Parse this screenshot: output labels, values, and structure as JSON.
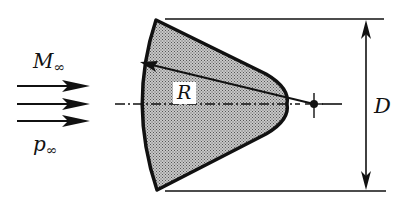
{
  "diagram": {
    "type": "aerodynamic body cross-section",
    "colors": {
      "stroke": "#111111",
      "fill": "#a8a8a8",
      "background": "#ffffff"
    },
    "flow": {
      "mach_label": "M",
      "mach_subscript": "∞",
      "pressure_label": "p",
      "pressure_subscript": "∞",
      "arrow_count": 3,
      "direction": "left-to-right"
    },
    "body": {
      "radius_label": "R",
      "diameter_label": "D"
    },
    "centerline": {
      "style": "dash-dot",
      "center_marker": "filled dot with cross"
    }
  }
}
